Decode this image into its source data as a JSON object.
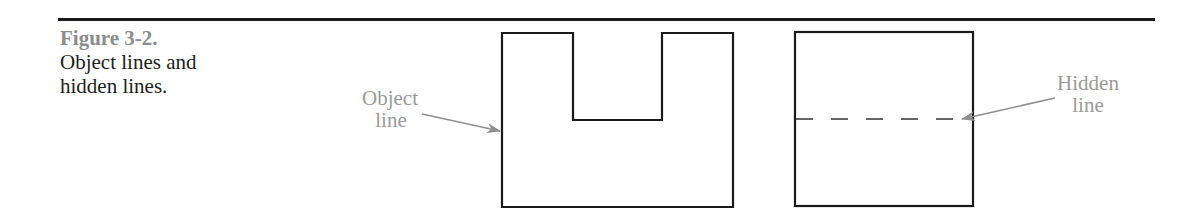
{
  "figure": {
    "number": "Figure 3-2.",
    "title_line1": "Object lines and",
    "title_line2": "hidden lines."
  },
  "diagram": {
    "left_view": {
      "shape": "U-shaped object outline",
      "callout": {
        "line1": "Object",
        "line2": "line"
      }
    },
    "right_view": {
      "shape": "square outline with dashed hidden line",
      "callout": {
        "line1": "Hidden",
        "line2": "line"
      }
    },
    "colors": {
      "object_line": "#1a1a1a",
      "callout_text": "#9a9a9a",
      "figure_number": "#8c8c8c",
      "arrow": "#8f8f8f"
    }
  }
}
